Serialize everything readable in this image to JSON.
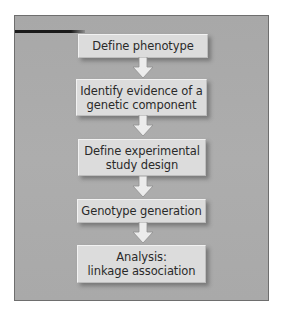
{
  "diagram": {
    "type": "flowchart",
    "direction": "top-to-bottom",
    "colors": {
      "panel_background": "#aaaaaa",
      "panel_border": "#6e6e6e",
      "box_fill": "#dcdcdc",
      "text": "#2a2a2a",
      "arrow_fill": "#ececec",
      "rule": "#1a1a1a"
    },
    "steps": [
      {
        "label": "Define phenotype"
      },
      {
        "label": "Identify evidence of a\ngenetic component"
      },
      {
        "label": "Define experimental\nstudy design"
      },
      {
        "label": "Genotype generation"
      },
      {
        "label": "Analysis:\nlinkage association"
      }
    ],
    "connectors": [
      {
        "from": 0,
        "to": 1,
        "icon": "down-arrow-icon"
      },
      {
        "from": 1,
        "to": 2,
        "icon": "down-arrow-icon"
      },
      {
        "from": 2,
        "to": 3,
        "icon": "down-arrow-icon"
      },
      {
        "from": 3,
        "to": 4,
        "icon": "down-arrow-icon"
      }
    ]
  }
}
